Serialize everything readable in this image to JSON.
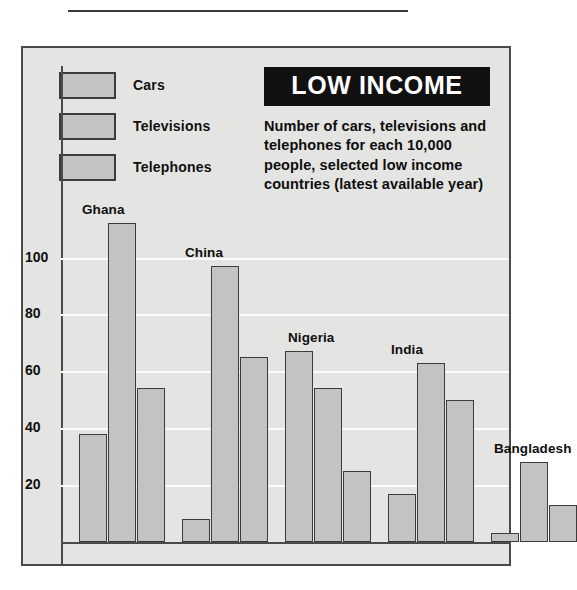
{
  "title": {
    "banner": "LOW INCOME",
    "subtitle": "Number of cars, televisions and telephones for each 10,000 people, selected low income countries (latest available year)"
  },
  "legend": {
    "position": "top-left",
    "items": [
      {
        "label": "Cars",
        "swatch_color": "#c3c3c3"
      },
      {
        "label": "Televisions",
        "swatch_color": "#c3c3c3"
      },
      {
        "label": "Telephones",
        "swatch_color": "#c3c3c3"
      }
    ]
  },
  "colors": {
    "bar_fill": "#c3c3c3",
    "bar_border": "#3c3c3c",
    "panel_background": "#e4e4e2",
    "panel_border": "#4a4a4a",
    "gridline": "#fbfbfb",
    "banner_background": "#111111",
    "banner_text": "#ffffff",
    "text": "#0f0f0f"
  },
  "chart_data": {
    "type": "bar",
    "title": "LOW INCOME",
    "subtitle": "Number of cars, televisions and telephones for each 10,000 people, selected low income countries (latest available year)",
    "xlabel": "",
    "ylabel": "",
    "ylim": [
      0,
      120
    ],
    "yticks": [
      20,
      40,
      60,
      80,
      100
    ],
    "ytick_labels": [
      "20",
      "40",
      "60",
      "80",
      "100"
    ],
    "grid": true,
    "legend_position": "top-left",
    "categories": [
      "Ghana",
      "China",
      "Nigeria",
      "India",
      "Bangladesh"
    ],
    "series": [
      {
        "name": "Cars",
        "values": [
          38,
          8,
          67,
          17,
          3
        ]
      },
      {
        "name": "Televisions",
        "values": [
          112,
          97,
          54,
          63,
          28
        ]
      },
      {
        "name": "Telephones",
        "values": [
          54,
          65,
          25,
          50,
          13
        ]
      }
    ]
  }
}
